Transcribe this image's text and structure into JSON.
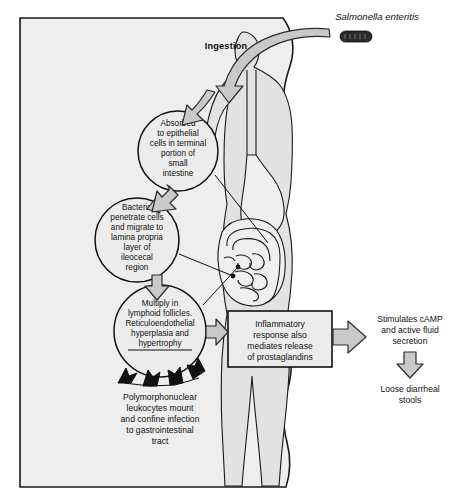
{
  "figure": {
    "title_label": "Salmonella enteritis",
    "ingestion_label": "Ingestion",
    "bacterium_icon": "bacterium-rod-icon",
    "body_icon": "human-body-silhouette-icon",
    "intestine_icon": "intestine-icon",
    "stomach_icon": "stomach-icon",
    "esophagus_icon": "esophagus-icon"
  },
  "nodes": {
    "absorbed": {
      "name": "absorbed-node",
      "lines": [
        "Absorbed",
        "to epithelial",
        "cells in terminal",
        "portion of",
        "small",
        "intestine"
      ]
    },
    "penetrate": {
      "name": "penetrate-node",
      "lines": [
        "Bacteria",
        "penetrate cells",
        "and migrate to",
        "lamina propria",
        "layer of",
        "ileocecal",
        "region"
      ]
    },
    "multiply": {
      "name": "multiply-node",
      "lines": [
        "Multiply in",
        "lymphoid follicles.",
        "Reticuloendothelial",
        "hyperplasia and",
        "hypertrophy"
      ]
    },
    "inflammatory": {
      "name": "inflammatory-node",
      "lines": [
        "Inflammatory",
        "response also",
        "mediates release",
        "of prostaglandins"
      ]
    },
    "camp": {
      "name": "camp-node",
      "lines": [
        "Stimulates cAMP",
        "and active fluid",
        "secretion"
      ]
    },
    "stools": {
      "name": "stools-node",
      "lines": [
        "Loose diarrheal",
        "stools"
      ]
    },
    "leukocytes": {
      "name": "leukocytes-node",
      "lines": [
        "Polymorphonuclear",
        "leukocytes mount",
        "and confine infection",
        "to gastrointestinal",
        "tract"
      ]
    }
  },
  "arrows": {
    "ingestion_arrow": "curved-ingestion-arrow",
    "to_absorbed": "arrow-to-absorbed",
    "to_penetrate": "arrow-to-penetrate",
    "to_multiply": "arrow-to-multiply",
    "to_inflammatory": "arrow-to-inflammatory",
    "to_camp": "arrow-to-camp",
    "to_stools": "arrow-to-stools",
    "leukocyte_arrows": "black-leukocyte-arrows"
  },
  "colors": {
    "panel_bg": "#eeeeee",
    "node_fill": "#ececec",
    "arrow_fill": "#c9c9c9",
    "outline": "#111111",
    "body_fill": "#e2e2e2"
  }
}
